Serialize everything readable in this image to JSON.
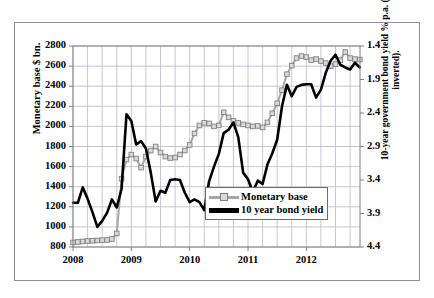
{
  "figure": {
    "caption": ""
  },
  "chart_data": {
    "type": "line",
    "title": "",
    "xlabel": "",
    "ylabel": "Monetary base $ bn.",
    "ylabel_right": "10-year government bond yield % p.a. (scale inverted).",
    "grid": true,
    "legend_position": "inside-bottom-center",
    "x_tick_labels": [
      "2008",
      "2009",
      "2010",
      "2011",
      "2012"
    ],
    "x_tick_values": [
      2008.0,
      2009.0,
      2010.0,
      2011.0,
      2012.0
    ],
    "xlim": [
      2008.0,
      2012.92
    ],
    "x_minor_gridline_interval_years": 0.25,
    "left_axis": {
      "label": "Monetary base $ bn.",
      "ticks": [
        800,
        1000,
        1200,
        1400,
        1600,
        1800,
        2000,
        2200,
        2400,
        2600,
        2800
      ],
      "ylim": [
        800,
        2800
      ],
      "inverted": false
    },
    "right_axis": {
      "label": "10-year government bond yield % p.a. (scale inverted).",
      "ticks": [
        1.4,
        1.9,
        2.4,
        2.9,
        3.4,
        3.9,
        4.4
      ],
      "ylim": [
        4.4,
        1.4
      ],
      "inverted": true
    },
    "series": [
      {
        "name": "Monetary base",
        "axis": "left",
        "units": "$ bn.",
        "color": "#a6a6a6",
        "marker": "square",
        "x": [
          2008.0,
          2008.083,
          2008.167,
          2008.25,
          2008.333,
          2008.417,
          2008.5,
          2008.583,
          2008.667,
          2008.75,
          2008.833,
          2008.917,
          2009.0,
          2009.083,
          2009.167,
          2009.25,
          2009.333,
          2009.417,
          2009.5,
          2009.583,
          2009.667,
          2009.75,
          2009.833,
          2009.917,
          2010.0,
          2010.083,
          2010.167,
          2010.25,
          2010.333,
          2010.417,
          2010.5,
          2010.583,
          2010.667,
          2010.75,
          2010.833,
          2010.917,
          2011.0,
          2011.083,
          2011.167,
          2011.25,
          2011.333,
          2011.417,
          2011.5,
          2011.583,
          2011.667,
          2011.75,
          2011.833,
          2011.917,
          2012.0,
          2012.083,
          2012.167,
          2012.25,
          2012.333,
          2012.417,
          2012.5,
          2012.583,
          2012.667,
          2012.75,
          2012.833,
          2012.917
        ],
        "values": [
          845,
          850,
          855,
          860,
          862,
          865,
          868,
          870,
          880,
          935,
          1480,
          1670,
          1720,
          1680,
          1590,
          1700,
          1760,
          1800,
          1740,
          1700,
          1685,
          1690,
          1720,
          1760,
          1815,
          1930,
          2010,
          2035,
          2030,
          2000,
          2010,
          2140,
          2090,
          2055,
          2035,
          2020,
          2010,
          2000,
          2005,
          1990,
          2040,
          2130,
          2230,
          2360,
          2520,
          2605,
          2680,
          2700,
          2690,
          2660,
          2670,
          2650,
          2630,
          2600,
          2620,
          2660,
          2740,
          2680,
          2670,
          2665
        ]
      },
      {
        "name": "10 year bond yield",
        "axis": "right",
        "units": "% p.a.",
        "color": "#000000",
        "marker": "none",
        "x": [
          2008.0,
          2008.083,
          2008.167,
          2008.25,
          2008.333,
          2008.417,
          2008.5,
          2008.583,
          2008.667,
          2008.75,
          2008.833,
          2008.917,
          2009.0,
          2009.083,
          2009.167,
          2009.25,
          2009.333,
          2009.417,
          2009.5,
          2009.583,
          2009.667,
          2009.75,
          2009.833,
          2009.917,
          2010.0,
          2010.083,
          2010.167,
          2010.25,
          2010.333,
          2010.417,
          2010.5,
          2010.583,
          2010.667,
          2010.75,
          2010.833,
          2010.917,
          2011.0,
          2011.083,
          2011.167,
          2011.25,
          2011.333,
          2011.417,
          2011.5,
          2011.583,
          2011.667,
          2011.75,
          2011.833,
          2011.917,
          2012.0,
          2012.083,
          2012.167,
          2012.25,
          2012.333,
          2012.417,
          2012.5,
          2012.583,
          2012.667,
          2012.75,
          2012.833,
          2012.917
        ],
        "values": [
          3.74,
          3.74,
          3.51,
          3.68,
          3.88,
          4.1,
          4.01,
          3.89,
          3.69,
          3.81,
          3.53,
          2.42,
          2.52,
          2.87,
          2.82,
          2.93,
          3.29,
          3.72,
          3.56,
          3.59,
          3.4,
          3.39,
          3.4,
          3.59,
          3.73,
          3.69,
          3.73,
          3.85,
          3.42,
          3.2,
          3.01,
          2.7,
          2.65,
          2.54,
          2.76,
          3.29,
          3.39,
          3.58,
          3.41,
          3.46,
          3.17,
          3.0,
          2.8,
          2.3,
          1.98,
          2.15,
          2.01,
          1.98,
          1.97,
          1.97,
          2.17,
          2.05,
          1.8,
          1.62,
          1.53,
          1.68,
          1.72,
          1.75,
          1.65,
          1.72
        ]
      }
    ]
  },
  "legend": {
    "items": [
      {
        "label": "Monetary base",
        "style": "gray-line-square-marker"
      },
      {
        "label": "10 year bond yield",
        "style": "thick-black-line"
      }
    ]
  },
  "axes": {
    "left_ticks": [
      "2800",
      "2600",
      "2400",
      "2200",
      "2000",
      "1800",
      "1600",
      "1400",
      "1200",
      "1000",
      "800"
    ],
    "right_ticks": [
      "1.4",
      "1.9",
      "2.4",
      "2.9",
      "3.4",
      "3.9",
      "4.4"
    ],
    "x_ticks": [
      "2008",
      "2009",
      "2010",
      "2011",
      "2012"
    ],
    "left_title": "Monetary base $ bn.",
    "right_title_line1": "10-year government bond yield % p.a. (scale",
    "right_title_line2": "inverted)."
  },
  "colors": {
    "monetary_base_line": "#a6a6a6",
    "monetary_base_marker_fill": "#d9d9d9",
    "monetary_base_marker_edge": "#808080",
    "bond_yield_line": "#000000",
    "gridline": "#b9b9c8",
    "axis": "#808080",
    "frame": "#8f8f8f",
    "background": "#ffffff"
  }
}
